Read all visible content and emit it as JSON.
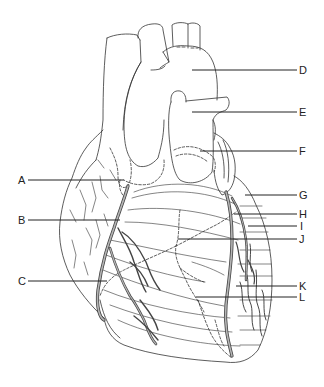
{
  "diagram": {
    "labels": [
      {
        "id": "A",
        "text": "A",
        "side": "left",
        "y": 180,
        "x1": 28,
        "x2": 124
      },
      {
        "id": "B",
        "text": "B",
        "side": "left",
        "y": 220,
        "x1": 28,
        "x2": 120
      },
      {
        "id": "C",
        "text": "C",
        "side": "left",
        "y": 281,
        "x1": 28,
        "x2": 107
      },
      {
        "id": "D",
        "text": "D",
        "side": "right",
        "y": 70,
        "x1": 192,
        "x2": 297
      },
      {
        "id": "E",
        "text": "E",
        "side": "right",
        "y": 112,
        "x1": 192,
        "x2": 297
      },
      {
        "id": "F",
        "text": "F",
        "side": "right",
        "y": 151,
        "x1": 200,
        "x2": 297
      },
      {
        "id": "G",
        "text": "G",
        "side": "right",
        "y": 195,
        "x1": 245,
        "x2": 297
      },
      {
        "id": "H",
        "text": "H",
        "side": "right",
        "y": 214,
        "x1": 234,
        "x2": 297
      },
      {
        "id": "I",
        "text": "I",
        "side": "right",
        "y": 226,
        "x1": 248,
        "x2": 297
      },
      {
        "id": "J",
        "text": "J",
        "side": "right",
        "y": 239,
        "x1": 178,
        "x2": 297
      },
      {
        "id": "K",
        "text": "K",
        "side": "right",
        "y": 286,
        "x1": 236,
        "x2": 297
      },
      {
        "id": "L",
        "text": "L",
        "side": "right",
        "y": 297,
        "x1": 196,
        "x2": 297
      }
    ],
    "colors": {
      "outline": "#333333",
      "vessel_fill": "#b5b5b5",
      "leader": "#222222",
      "background": "#ffffff"
    }
  }
}
